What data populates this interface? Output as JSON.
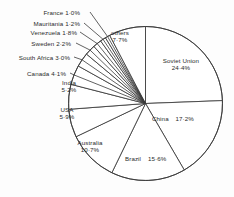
{
  "chart_data": {
    "type": "pie",
    "title": "",
    "subtitle": "",
    "xlabel": "",
    "ylabel": "",
    "legend_position": "none",
    "grid": false,
    "units": "percent",
    "total": 100.0,
    "start_angle_deg": 0,
    "direction": "clockwise",
    "categories": [
      "Soviet Union",
      "China",
      "Brazil",
      "Australia",
      "USA",
      "India",
      "Canada",
      "South Africa",
      "Sweden",
      "Venezuela",
      "Mauritania",
      "France",
      "others"
    ],
    "values": [
      24.4,
      17.2,
      15.6,
      10.7,
      5.9,
      5.2,
      4.1,
      3.0,
      2.2,
      1.8,
      1.2,
      1.0,
      7.7
    ],
    "slices": [
      {
        "name": "Soviet Union",
        "value": 24.4,
        "label": "Soviet Union",
        "pct_text": "24·4%",
        "label_style": "stack"
      },
      {
        "name": "China",
        "value": 17.2,
        "label": "China",
        "pct_text": "17·2%",
        "label_style": "inline"
      },
      {
        "name": "Brazil",
        "value": 15.6,
        "label": "Brazil",
        "pct_text": "15·6%",
        "label_style": "inline"
      },
      {
        "name": "Australia",
        "value": 10.7,
        "label": "Australia",
        "pct_text": "10·7%",
        "label_style": "stack"
      },
      {
        "name": "USA",
        "value": 5.9,
        "label": "USA",
        "pct_text": "5·9%",
        "label_style": "stack"
      },
      {
        "name": "India",
        "value": 5.2,
        "label": "India",
        "pct_text": "5·2%",
        "label_style": "stack"
      },
      {
        "name": "Canada",
        "value": 4.1,
        "label": "Canada",
        "pct_text": "4·1%",
        "label_style": "leader"
      },
      {
        "name": "South Africa",
        "value": 3.0,
        "label": "South Africa",
        "pct_text": "3·0%",
        "label_style": "leader"
      },
      {
        "name": "Sweden",
        "value": 2.2,
        "label": "Sweden",
        "pct_text": "2·2%",
        "label_style": "leader"
      },
      {
        "name": "Venezuela",
        "value": 1.8,
        "label": "Venezuela",
        "pct_text": "1·8%",
        "label_style": "leader"
      },
      {
        "name": "Mauritania",
        "value": 1.2,
        "label": "Mauritania",
        "pct_text": "1·2%",
        "label_style": "leader"
      },
      {
        "name": "France",
        "value": 1.0,
        "label": "France",
        "pct_text": "1·0%",
        "label_style": "leader"
      },
      {
        "name": "others",
        "value": 7.7,
        "label": "others",
        "pct_text": "7·7%",
        "label_style": "stack"
      }
    ],
    "colors": {
      "slice_fill": "#ffffff",
      "slice_stroke": "#3a3a3a",
      "leader_stroke": "#3a3a3a",
      "text": "#2b2b2b",
      "background": "#fdfdfd"
    }
  },
  "labels": {
    "france": {
      "name": "France",
      "pct": "1·0%"
    },
    "mauritania": {
      "name": "Mauritania",
      "pct": "1·2%"
    },
    "venezuela": {
      "name": "Venezuela",
      "pct": "1·8%"
    },
    "sweden": {
      "name": "Sweden",
      "pct": "2·2%"
    },
    "south_africa": {
      "name": "South Africa",
      "pct": "3·0%"
    },
    "canada": {
      "name": "Canada",
      "pct": "4·1%"
    },
    "india": {
      "name": "India",
      "pct": "5·2%"
    },
    "usa": {
      "name": "USA",
      "pct": "5·9%"
    },
    "australia": {
      "name": "Australia",
      "pct": "10·7%"
    },
    "brazil": {
      "name": "Brazil",
      "pct": "15·6%"
    },
    "china": {
      "name": "China",
      "pct": "17·2%"
    },
    "soviet_union": {
      "name": "Soviet Union",
      "pct": "24·4%"
    },
    "others": {
      "name": "others",
      "pct": "7·7%"
    }
  }
}
